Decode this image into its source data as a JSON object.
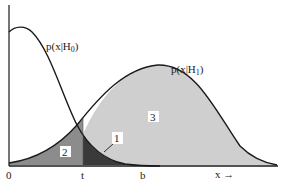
{
  "figure": {
    "curve_h0_label": "p(x|H",
    "curve_h0_sub": "0",
    "curve_h1_label": "p(x|H",
    "curve_h1_sub": "1",
    "region_labels": [
      "1",
      "2",
      "3"
    ],
    "axis_ticks": [
      "0",
      "t",
      "b"
    ],
    "x_axis_label": "x →",
    "colors": {
      "line": "#1a1a1a",
      "region_1": "#3a3a3a",
      "region_2": "#8c8c8c",
      "region_3": "#cfcfcf",
      "background": "#ffffff"
    }
  }
}
